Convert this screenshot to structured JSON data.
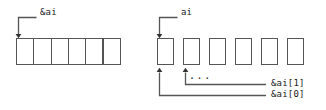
{
  "figure": {
    "background_color": "#ffffff",
    "stroke_color": "#555555",
    "text_color": "#1a1a1a"
  },
  "left_diagram": {
    "name": "contiguous-array-block",
    "pointer_label": "&ai",
    "cell_count": 6,
    "cells": [
      "",
      "",
      "",
      "",
      "",
      ""
    ],
    "geometry": {
      "x": 16,
      "y": 38,
      "cell_width": 17.3,
      "height": 27
    },
    "arrow": {
      "label_x": 40,
      "label_y": 12,
      "elbow_x": 18,
      "elbow_y": 17,
      "elbow_right_x": 36,
      "tip_y": 36
    }
  },
  "right_diagram": {
    "name": "separated-array-cells",
    "pointer_label": "ai",
    "cell_count": 6,
    "cells": [
      "",
      "",
      "",
      "",
      "",
      ""
    ],
    "ellipsis": "...",
    "geometry": {
      "x": 157,
      "y": 38,
      "cell_width": 17,
      "cell_gap": 9,
      "height": 27
    },
    "arrow": {
      "label_x": 181,
      "label_y": 12,
      "elbow_x": 159,
      "elbow_y": 17,
      "elbow_right_x": 177,
      "tip_y": 36
    },
    "index_labels": [
      {
        "text": "&ai[1]",
        "from_cell": 1,
        "x": 272,
        "y": 80
      },
      {
        "text": "&ai[0]",
        "from_cell": 0,
        "x": 272,
        "y": 92
      }
    ],
    "ellipsis_position": {
      "x": 188,
      "y": 74
    }
  }
}
